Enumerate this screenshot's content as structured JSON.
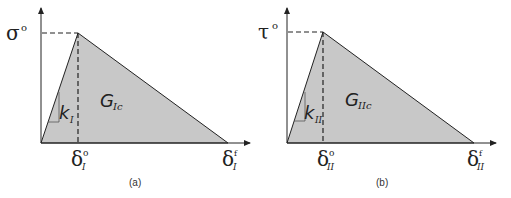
{
  "colors": {
    "fill": "#c8c8c8",
    "stroke": "#222222",
    "background": "#ffffff"
  },
  "panels": [
    {
      "caption": "(a)",
      "y_label": "σ",
      "y_label_sup": "o",
      "x_label_onset": "δ",
      "x_label_onset_sup": "o",
      "x_label_onset_sub": "I",
      "x_label_final": "δ",
      "x_label_final_sup": "f",
      "x_label_final_sub": "I",
      "stiffness_label": "k",
      "stiffness_sub": "I",
      "area_label": "G",
      "area_sub": "Ic"
    },
    {
      "caption": "(b)",
      "y_label": "τ",
      "y_label_sup": "o",
      "x_label_onset": "δ",
      "x_label_onset_sup": "o",
      "x_label_onset_sub": "II",
      "x_label_final": "δ",
      "x_label_final_sup": "f",
      "x_label_final_sub": "II",
      "stiffness_label": "k",
      "stiffness_sub": "II",
      "area_label": "G",
      "area_sub": "IIc"
    }
  ]
}
